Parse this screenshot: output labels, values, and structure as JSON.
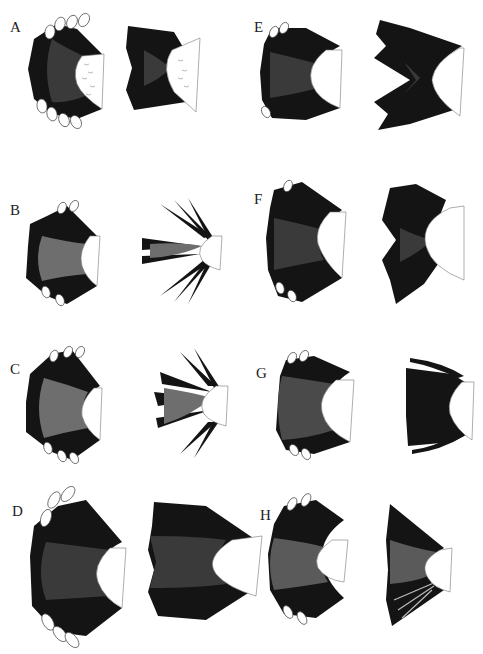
{
  "figure": {
    "colors": {
      "dark": "#141414",
      "mid": "#3a3a3a",
      "grey": "#6e6e6e",
      "light_grey": "#8a8a8a",
      "outline": "#555555",
      "background": "#ffffff"
    },
    "panels": [
      {
        "label": "A",
        "x": 10,
        "y": 18,
        "style": "fan-tipped",
        "second": "bowtie"
      },
      {
        "label": "B",
        "x": 10,
        "y": 203,
        "style": "fan-grey",
        "second": "spiky"
      },
      {
        "label": "C",
        "x": 10,
        "y": 350,
        "style": "fan-grey",
        "second": "spiky"
      },
      {
        "label": "D",
        "x": 10,
        "y": 498,
        "style": "fan-large",
        "second": "wide"
      },
      {
        "label": "E",
        "x": 254,
        "y": 18,
        "style": "fan-dark",
        "second": "bowtie-large"
      },
      {
        "label": "F",
        "x": 254,
        "y": 192,
        "style": "fan-dark",
        "second": "bowtie-large"
      },
      {
        "label": "G",
        "x": 254,
        "y": 366,
        "style": "fan-textured",
        "second": "compact"
      },
      {
        "label": "H",
        "x": 258,
        "y": 508,
        "style": "fan-textured",
        "second": "narrow"
      }
    ]
  }
}
